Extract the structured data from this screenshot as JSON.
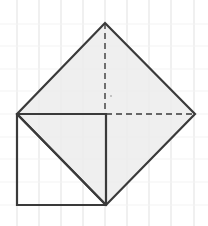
{
  "diagram": {
    "grid": {
      "vertical_x": [
        17,
        39,
        61,
        83,
        105,
        127,
        149,
        171,
        194
      ],
      "horizontal_y": [
        24,
        46,
        69,
        91,
        114,
        137,
        159,
        182,
        205
      ],
      "color": "#e6e6e6"
    },
    "colors": {
      "stroke": "#3a3a3a",
      "fill": "#ececec",
      "background": "#ffffff"
    },
    "diamond": {
      "vertices": [
        [
          105,
          23
        ],
        [
          195,
          114
        ],
        [
          106,
          205
        ],
        [
          17,
          114
        ]
      ]
    },
    "square": {
      "vertices": [
        [
          17,
          114
        ],
        [
          106,
          114
        ],
        [
          106,
          205
        ],
        [
          17,
          205
        ]
      ]
    },
    "diagonal": {
      "from": [
        17,
        114
      ],
      "to": [
        106,
        205
      ]
    },
    "dashed_vertical": {
      "from": [
        105,
        23
      ],
      "to": [
        105,
        114
      ]
    },
    "dashed_horizontal": {
      "from": [
        106,
        114
      ],
      "to": [
        195,
        114
      ]
    },
    "center_mark": [
      111,
      96
    ]
  }
}
